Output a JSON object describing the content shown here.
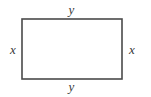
{
  "figure": {
    "type": "rectangle-diagram",
    "background_color": "#ffffff",
    "stroke_color": "#4a4a4a",
    "stroke_width": 1.6,
    "label_color": "#3a3a3a",
    "rectangle": {
      "x": 22,
      "y": 19,
      "width": 100,
      "height": 60
    },
    "labels": {
      "top": "y",
      "bottom": "y",
      "left": "x",
      "right": "x"
    }
  },
  "chart_data": {
    "type": "diagram",
    "title": "",
    "shape": "rectangle",
    "annotations": [
      {
        "name": "top-side",
        "text": "y",
        "position": "above-top-edge"
      },
      {
        "name": "bottom-side",
        "text": "y",
        "position": "below-bottom-edge"
      },
      {
        "name": "left-side",
        "text": "x",
        "position": "left-of-left-edge"
      },
      {
        "name": "right-side",
        "text": "x",
        "position": "right-of-right-edge"
      }
    ],
    "xlabel": "",
    "ylabel": ""
  }
}
